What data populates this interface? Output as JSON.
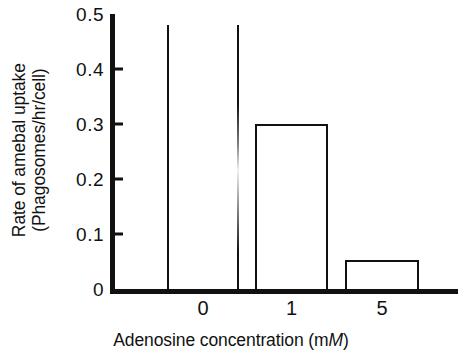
{
  "chart_data": {
    "type": "bar",
    "title": "",
    "subtitle": "",
    "xlabel_parts": {
      "before": "Adenosine concentration (m",
      "italic": "M",
      "after": ")"
    },
    "xlabel": "Adenosine concentration (mM)",
    "ylabel_line1": "Rate of amebal uptake",
    "ylabel_line2": "(Phagosomes/hr/cell)",
    "ylabel": "Rate of amebal uptake (Phagosomes/hr/cell)",
    "categories": [
      "0",
      "1",
      "5"
    ],
    "values": [
      0.48,
      0.3,
      0.053
    ],
    "ylim": [
      0,
      0.5
    ],
    "yticks": [
      0,
      0.1,
      0.2,
      0.3,
      0.4,
      0.5
    ],
    "ytick_labels": [
      "0",
      "0.1",
      "0.2",
      "0.3",
      "0.4",
      "0.5"
    ],
    "xtick_labels": [
      "0",
      "1",
      "5"
    ],
    "grid": false,
    "legend": false,
    "legend_position": "none",
    "bar_style": "outline",
    "series": [
      {
        "name": "Rate of amebal uptake",
        "values": [
          0.48,
          0.3,
          0.053
        ]
      }
    ],
    "colors": {
      "axis": "#111111",
      "bar_outline": "#111111",
      "bar_fill": "#ffffff",
      "background": "#ffffff"
    }
  }
}
